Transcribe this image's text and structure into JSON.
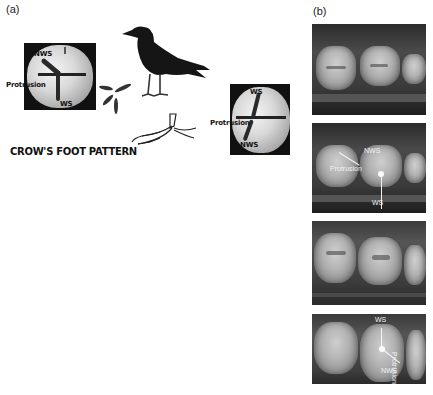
{
  "figure": {
    "panel_a": {
      "label": "(a)",
      "left_tooth": {
        "labels": {
          "nws": "NWS",
          "protrusion": "Protrusion",
          "ws": "WS"
        }
      },
      "right_tooth": {
        "labels": {
          "ws": "WS",
          "protrusion": "Protrusion",
          "nws": "NWS"
        }
      },
      "caption": "CROW'S FOOT PATTERN",
      "illustrations": [
        "crow",
        "crow-footprint",
        "crow-foot"
      ]
    },
    "panel_b": {
      "label": "(b)",
      "photos": [
        {
          "id": "photo-1",
          "annotations": []
        },
        {
          "id": "photo-2",
          "annotations": {
            "nws": "NWS",
            "protrusion": "Protrusion",
            "ws": "WS"
          }
        },
        {
          "id": "photo-3",
          "annotations": []
        },
        {
          "id": "photo-4",
          "annotations": {
            "ws": "WS",
            "protrusion": "Protrusion",
            "nws": "NWS"
          }
        }
      ]
    },
    "colors": {
      "background": "#ffffff",
      "annotation_dark": "#111111",
      "annotation_light": "#f5f5f5"
    }
  }
}
